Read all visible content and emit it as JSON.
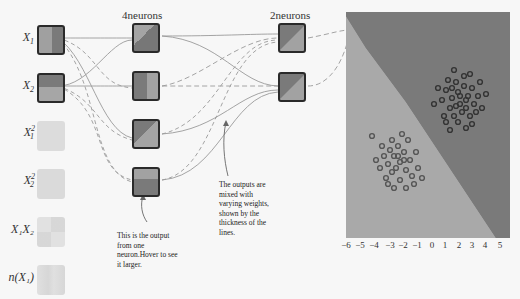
{
  "layers": {
    "hidden1": {
      "title": "4neurons"
    },
    "hidden2": {
      "title": "2neurons"
    }
  },
  "features": [
    {
      "id": "x1",
      "label": "X",
      "sub": "1",
      "sup": "",
      "active": true
    },
    {
      "id": "x2",
      "label": "X",
      "sub": "2",
      "sup": "",
      "active": true
    },
    {
      "id": "x1sq",
      "label": "X",
      "sub": "1",
      "sup": "2",
      "active": false
    },
    {
      "id": "x2sq",
      "label": "X",
      "sub": "2",
      "sup": "2",
      "active": false
    },
    {
      "id": "x1x2",
      "label": "X₁X₂",
      "sub": "",
      "sup": "",
      "active": false
    },
    {
      "id": "sinx1",
      "label": "n(X₁)",
      "sub": "",
      "sup": "",
      "active": false
    }
  ],
  "annotations": {
    "neuron_output": "This is the output from one neuron.Hover to see it larger.",
    "weights": "The outputs are mixed with varying weights, shown by the thickness of the lines."
  },
  "plot": {
    "x_ticks": [
      "−6",
      "−5",
      "−4",
      "−3",
      "−2",
      "−1",
      "0",
      "1",
      "2",
      "3",
      "4",
      "5"
    ],
    "colors": {
      "region_dark": "#7a7a7a",
      "region_light": "#a9a9a9",
      "point_dark": "#3a3a3a",
      "point_light": "#6a6a6a"
    },
    "clusters": [
      {
        "name": "upper-right",
        "center_x": 2,
        "center_y": 2,
        "class": "dark"
      },
      {
        "name": "lower-left",
        "center_x": -2,
        "center_y": -2,
        "class": "light"
      }
    ]
  }
}
